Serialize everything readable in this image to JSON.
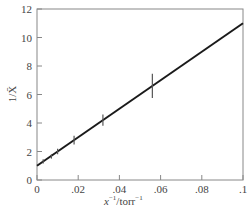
{
  "chart_data": {
    "type": "line",
    "title": "",
    "xlabel": "x⁻¹/torr⁻¹",
    "ylabel": "1/X̄",
    "xlim": [
      0,
      0.1
    ],
    "ylim": [
      0,
      12
    ],
    "grid": false,
    "legend": null,
    "x_ticks": [
      0,
      0.02,
      0.04,
      0.06,
      0.08,
      0.1
    ],
    "x_tick_labels": [
      "0",
      ".02",
      ".04",
      ".06",
      ".08",
      ".1"
    ],
    "y_ticks": [
      0,
      2,
      4,
      6,
      8,
      10,
      12
    ],
    "y_tick_labels": [
      "0",
      "2",
      "4",
      "6",
      "8",
      "10",
      "12"
    ],
    "series": [
      {
        "name": "data",
        "kind": "points_with_error_bars",
        "x": [
          0.003,
          0.007,
          0.01,
          0.018,
          0.032,
          0.056
        ],
        "y": [
          1.3,
          1.65,
          2.0,
          2.8,
          4.2,
          6.6
        ],
        "y_error": [
          0.15,
          0.15,
          0.2,
          0.3,
          0.4,
          0.85
        ]
      },
      {
        "name": "linear fit",
        "kind": "line",
        "x": [
          0.0,
          0.1
        ],
        "y": [
          1.0,
          11.0
        ]
      }
    ]
  },
  "axes": {
    "xlabel_main": "x",
    "xlabel_sup1": "−1",
    "xlabel_unit": "/torr",
    "xlabel_sup2": "−1",
    "ylabel": "1/X̄"
  },
  "colors": {
    "line": "#1a1a1a",
    "axis": "#888888",
    "text": "#444444"
  }
}
